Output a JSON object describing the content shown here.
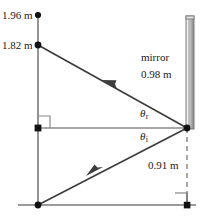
{
  "figure": {
    "labels": {
      "height_top": "1.96 m",
      "height_source": "1.82 m",
      "mirror": "mirror",
      "mirror_height": "0.98 m",
      "theta_reflection": "θ",
      "theta_reflection_sub": "r",
      "theta_incidence": "θ",
      "theta_incidence_sub": "i",
      "distance_below": "0.91 m"
    },
    "colors": {
      "ray": "#3d3d3d",
      "axis": "#7a7a7a",
      "normal": "#8a8a8a",
      "mirror_face": "#b9b9b9",
      "mirror_edge": "#6e6e6e",
      "mirror_highlight": "#ededed",
      "dot": "#111111",
      "dashed": "#8a8a8a",
      "text": "#1a1a1a"
    },
    "geometry": {
      "vertical_axis_x": 38,
      "ground_y": 205,
      "mirror_x": 187,
      "vertex_y": 128,
      "point_196_y": 15,
      "point_182_y": 45
    }
  }
}
